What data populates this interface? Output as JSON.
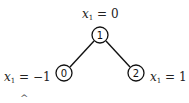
{
  "diagram": {
    "type": "tree",
    "nodes": [
      {
        "id": "1",
        "label": "1",
        "annotation_var": "x",
        "annotation_sub": "1",
        "annotation_rest": " = 0",
        "cx": 100,
        "cy": 35
      },
      {
        "id": "0",
        "label": "0",
        "annotation_var": "x",
        "annotation_sub": "1",
        "annotation_rest": " = −1",
        "cx": 64,
        "cy": 73
      },
      {
        "id": "2",
        "label": "2",
        "annotation_var": "x",
        "annotation_sub": "1",
        "annotation_rest": " = 1",
        "cx": 136,
        "cy": 73
      }
    ],
    "edges": [
      {
        "from": "1",
        "to": "0"
      },
      {
        "from": "1",
        "to": "2"
      }
    ],
    "partial_glyph": "^"
  }
}
